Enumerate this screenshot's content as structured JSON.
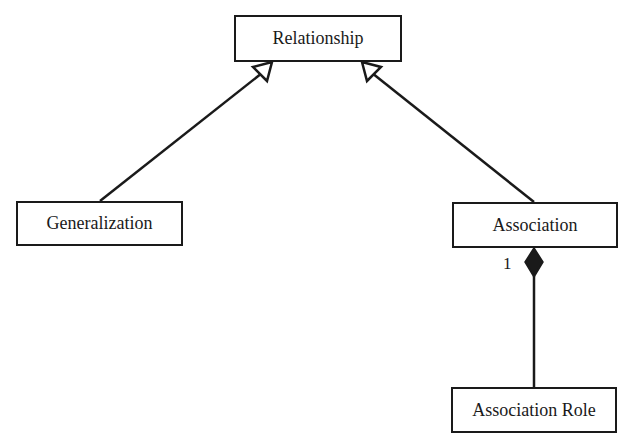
{
  "diagram": {
    "type": "uml-class-diagram",
    "colors": {
      "stroke": "#1a1a1a",
      "fill": "#ffffff",
      "background": "#ffffff"
    },
    "nodes": [
      {
        "id": "relationship",
        "label": "Relationship"
      },
      {
        "id": "generalization",
        "label": "Generalization"
      },
      {
        "id": "association",
        "label": "Association"
      },
      {
        "id": "association_role",
        "label": "Association Role"
      }
    ],
    "edges": [
      {
        "from": "generalization",
        "to": "relationship",
        "kind": "generalization",
        "arrowhead": "hollow-triangle"
      },
      {
        "from": "association",
        "to": "relationship",
        "kind": "generalization",
        "arrowhead": "hollow-triangle"
      },
      {
        "from": "association_role",
        "to": "association",
        "kind": "composition",
        "arrowhead": "filled-diamond",
        "multiplicity": "1"
      }
    ]
  }
}
